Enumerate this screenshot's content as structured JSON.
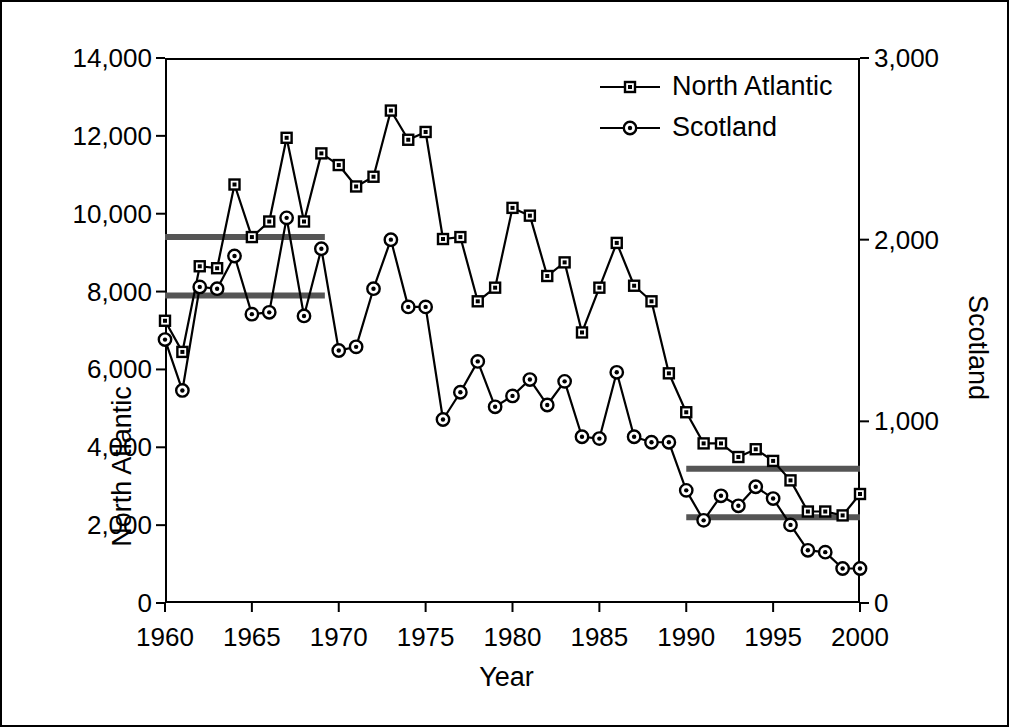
{
  "figure": {
    "background_color": "#ffffff",
    "frame_color": "#000000"
  },
  "chart_data": {
    "type": "line",
    "title": "",
    "xlabel": "Year",
    "ylabel": "North Atlantic",
    "y2label": "Scotland",
    "xlim": [
      1960,
      2000
    ],
    "ylim": [
      0,
      14000
    ],
    "y2lim": [
      0,
      3000
    ],
    "grid": false,
    "legend_position": "top-right",
    "xticks": [
      1960,
      1965,
      1970,
      1975,
      1980,
      1985,
      1990,
      1995,
      2000
    ],
    "xtick_labels": [
      "1960",
      "1965",
      "1970",
      "1975",
      "1980",
      "1985",
      "1990",
      "1995",
      "2000"
    ],
    "yticks": [
      0,
      2000,
      4000,
      6000,
      8000,
      10000,
      12000,
      14000
    ],
    "ytick_labels": [
      "0",
      "2,000",
      "4,000",
      "6,000",
      "8,000",
      "10,000",
      "12,000",
      "14,000"
    ],
    "y2ticks": [
      0,
      1000,
      2000,
      3000
    ],
    "y2tick_labels": [
      "0",
      "1,000",
      "2,000",
      "3,000"
    ],
    "x": [
      1960,
      1961,
      1962,
      1963,
      1964,
      1965,
      1966,
      1967,
      1968,
      1969,
      1970,
      1971,
      1972,
      1973,
      1974,
      1975,
      1976,
      1977,
      1978,
      1979,
      1980,
      1981,
      1982,
      1983,
      1984,
      1985,
      1986,
      1987,
      1988,
      1989,
      1990,
      1991,
      1992,
      1993,
      1994,
      1995,
      1996,
      1997,
      1998,
      1999,
      2000
    ],
    "series": [
      {
        "name": "North Atlantic",
        "axis": "left",
        "marker": "square",
        "color": "#000000",
        "values": [
          7250,
          6450,
          8650,
          8600,
          10750,
          9400,
          9800,
          11950,
          9800,
          11550,
          11250,
          10700,
          10950,
          12650,
          11900,
          12100,
          9350,
          9400,
          7750,
          8100,
          10150,
          9950,
          8400,
          8750,
          6950,
          8100,
          9250,
          8150,
          7750,
          5900,
          4900,
          4100,
          4100,
          3750,
          3950,
          3650,
          3150,
          2350,
          2350,
          2250,
          2800
        ]
      },
      {
        "name": "Scotland",
        "axis": "right",
        "marker": "circle",
        "color": "#000000",
        "values": [
          1450,
          1170,
          1740,
          1730,
          1910,
          1590,
          1600,
          2120,
          1580,
          1950,
          1390,
          1410,
          1730,
          2000,
          1630,
          1630,
          1010,
          1160,
          1330,
          1080,
          1140,
          1230,
          1090,
          1220,
          915,
          905,
          1270,
          915,
          885,
          885,
          620,
          455,
          590,
          535,
          640,
          575,
          430,
          290,
          280,
          190,
          190
        ]
      }
    ],
    "reference_lines": [
      {
        "name": "north-atlantic-mean-early",
        "axis": "left",
        "value": 9400,
        "x_start": 1960,
        "x_end": 1969.2,
        "color": "#555555"
      },
      {
        "name": "scotland-mean-early",
        "axis": "left",
        "value": 7900,
        "x_start": 1960,
        "x_end": 1969.2,
        "color": "#555555"
      },
      {
        "name": "north-atlantic-mean-late",
        "axis": "left",
        "value": 3450,
        "x_start": 1990.0,
        "x_end": 2000,
        "color": "#555555"
      },
      {
        "name": "scotland-mean-late",
        "axis": "left",
        "value": 2200,
        "x_start": 1990.0,
        "x_end": 2000,
        "color": "#555555"
      }
    ]
  },
  "legend": {
    "entries": [
      {
        "label": "North Atlantic",
        "marker": "square"
      },
      {
        "label": "Scotland",
        "marker": "circle"
      }
    ]
  },
  "axis_titles": {
    "left": "North Atlantic",
    "right": "Scotland",
    "bottom": "Year"
  }
}
